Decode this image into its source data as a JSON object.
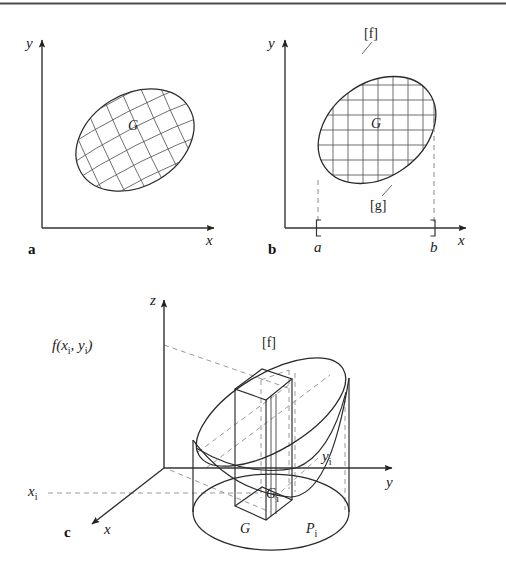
{
  "figure": {
    "top_rule_color": "#4a4a4a",
    "stroke_color": "#2b2b2b",
    "grid_color": "#555555",
    "dashed_color": "#8a8a8a",
    "background": "#ffffff"
  },
  "panels": [
    {
      "id": "a",
      "letter": "a",
      "axes": {
        "x_label": "x",
        "y_label": "y"
      },
      "region_label": "G",
      "description": "tilted ellipse with curvilinear grid"
    },
    {
      "id": "b",
      "letter": "b",
      "axes": {
        "x_label": "x",
        "y_label": "y"
      },
      "region_label": "G",
      "upper_curve_label": "[f]",
      "lower_curve_label": "[g]",
      "interval": {
        "left": "a",
        "right": "b",
        "left_bracket": "[",
        "right_bracket": "]"
      },
      "description": "tilted ellipse with rectangular grid and interval a..b on x axis"
    },
    {
      "id": "c",
      "letter": "c",
      "axes": {
        "x_label": "x",
        "y_label": "y",
        "z_label": "z"
      },
      "surface_label": "[f]",
      "height_label": "f(x",
      "height_label_sub1": "i",
      "height_label_mid": ", y",
      "height_label_sub2": "i",
      "height_label_end": ")",
      "base_label": "G",
      "cell_label": "G",
      "cell_label_sub": "i",
      "point_label": "P",
      "point_label_sub": "i",
      "x_tick_label": "x",
      "x_tick_sub": "i",
      "y_tick_label": "y",
      "y_tick_sub": "i",
      "description": "3D solid over region G with column over subregion G_i and height f(x_i,y_i)"
    }
  ]
}
